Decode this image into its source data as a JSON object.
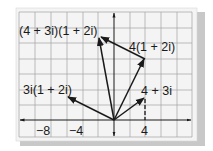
{
  "diagram": {
    "colors": {
      "paper": "#f4f4f4",
      "grid": "#9a9a9a",
      "ink": "#1a1a1a",
      "shadow": "#c8c8c8"
    },
    "axes": {
      "x_ticks": [
        {
          "value": -8,
          "label": "−8"
        },
        {
          "value": -4,
          "label": "−4"
        },
        {
          "value": 4,
          "label": "4"
        }
      ],
      "grid_step": 2
    },
    "vectors": [
      {
        "id": "v1",
        "label": "4 + 3i",
        "re": 4,
        "im": 3
      },
      {
        "id": "v2",
        "label": "4(1 + 2i)",
        "re": 4,
        "im": 8
      },
      {
        "id": "v3",
        "label": "3i(1 + 2i)",
        "re": -6,
        "im": 3
      },
      {
        "id": "v4",
        "label": "(4 + 3i)(1 + 2i)",
        "re": -2,
        "im": 11
      }
    ],
    "labels": {
      "product": "(4 + 3i)(1 + 2i)",
      "scaled_real": "4(1 + 2i)",
      "scaled_imag": "3i(1 + 2i)",
      "factor": "4 + 3i",
      "tick_neg8": "−8",
      "tick_neg4": "−4",
      "tick_4": "4"
    }
  }
}
